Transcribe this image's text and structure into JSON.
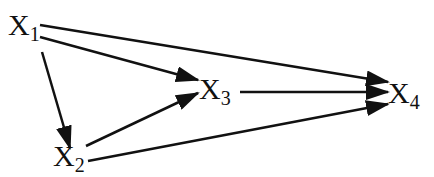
{
  "diagram": {
    "type": "directed-acyclic-graph",
    "nodes": [
      {
        "id": "X1",
        "label": "X",
        "subscript": "1"
      },
      {
        "id": "X2",
        "label": "X",
        "subscript": "2"
      },
      {
        "id": "X3",
        "label": "X",
        "subscript": "3"
      },
      {
        "id": "X4",
        "label": "X",
        "subscript": "4"
      }
    ],
    "edges": [
      {
        "from": "X1",
        "to": "X4"
      },
      {
        "from": "X1",
        "to": "X3"
      },
      {
        "from": "X1",
        "to": "X2"
      },
      {
        "from": "X2",
        "to": "X3"
      },
      {
        "from": "X2",
        "to": "X4"
      },
      {
        "from": "X3",
        "to": "X4"
      }
    ],
    "colors": {
      "line": "#111111",
      "background": "#ffffff"
    }
  }
}
